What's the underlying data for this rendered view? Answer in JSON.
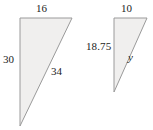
{
  "figure": {
    "background_color": "#ffffff",
    "fill_color": "#f0efee",
    "stroke_color": "#9a9a9a",
    "text_color": "#1c1c1c"
  },
  "triangles": [
    {
      "name": "left-triangle",
      "points": "20,18 72,18 20,126",
      "labels": {
        "top": "16",
        "leg": "30",
        "hypotenuse": "34"
      }
    },
    {
      "name": "right-triangle",
      "points": "114,18 147,18 114,92",
      "labels": {
        "top": "10",
        "leg": "18.75",
        "hypotenuse": "y"
      }
    }
  ]
}
